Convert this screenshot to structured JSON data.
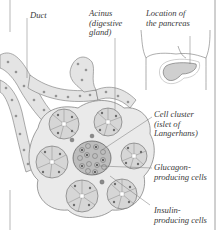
{
  "figure": {
    "labels": {
      "duct": "Duct",
      "acinus": {
        "line1": "Acinus",
        "line2": "(digestive",
        "line3": "gland)"
      },
      "location": {
        "line1": "Location of",
        "line2": "the pancreas"
      },
      "islet": {
        "line1": "Cell cluster",
        "line2": "(islet of",
        "line3": "Langerhans)"
      },
      "glucagon": {
        "line1": "Glucagon-",
        "line2": "producing cells"
      },
      "insulin": {
        "line1": "Insulin-",
        "line2": "producing cells"
      }
    },
    "colors": {
      "line": "#6e6e6e",
      "tissue_fill": "#e6e6e6",
      "cell_fill": "#d2d2d2",
      "nucleus": "#7a7a7a",
      "islet_fill": "#b9b9b9",
      "pancreas_fill": "#cfcfcf"
    }
  }
}
